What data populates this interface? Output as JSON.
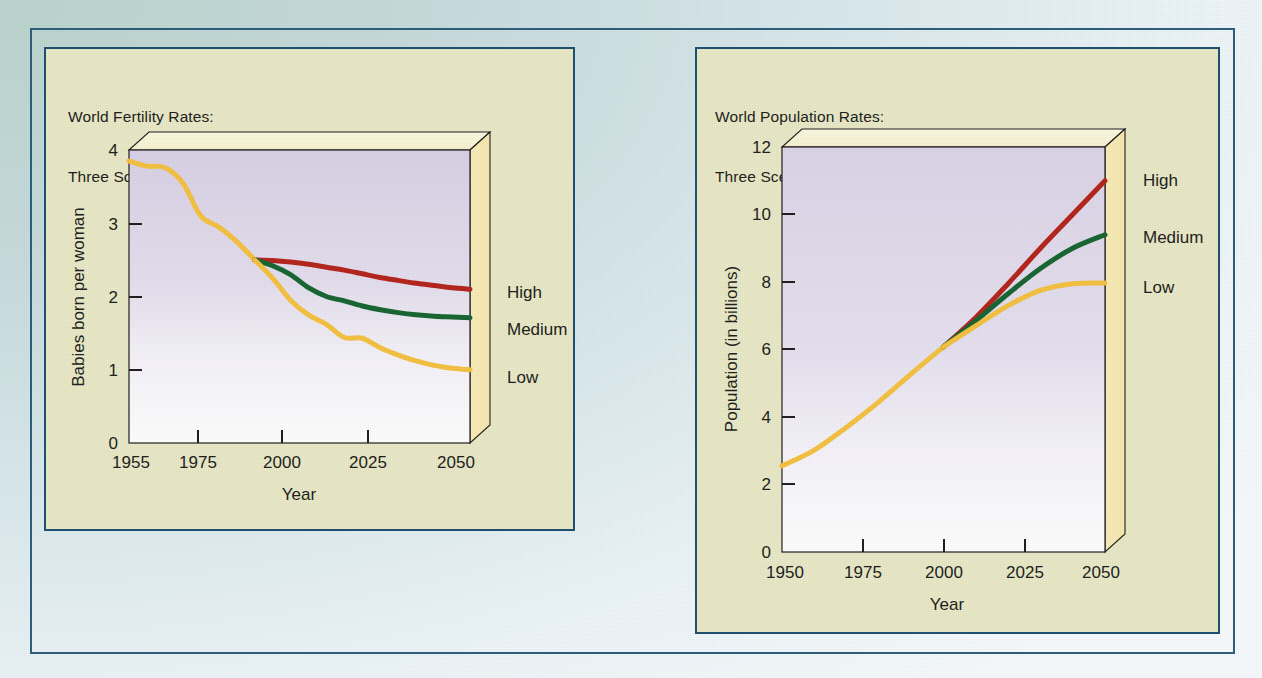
{
  "figure": {
    "background_top_left": "#bcd6cf",
    "background_bottom_right": "#f7fbfd",
    "frame_color": "#2d5f7c",
    "panel_fill": "#e9e9c8",
    "panel_border": "#1f5270"
  },
  "series_colors": {
    "high": "#b5271e",
    "medium": "#1a6634",
    "low": "#f5c242",
    "historical": "#f5c242"
  },
  "charts": [
    {
      "id": "fertility",
      "title_line1": "World Fertility Rates:",
      "title_line2": "Three Scenarios Projected by the UN",
      "legend": [
        "High",
        "Medium",
        "Low"
      ]
    },
    {
      "id": "population",
      "title_line1": "World Population Rates:",
      "title_line2": "Three Scenarios Projected by the UN",
      "legend": [
        "High",
        "Medium",
        "Low"
      ]
    }
  ],
  "chart_data": [
    {
      "type": "line",
      "id": "fertility",
      "title": "World Fertility Rates: Three Scenarios Projected by the UN",
      "xlabel": "Year",
      "ylabel": "Babies born per woman",
      "xlim": [
        1955,
        2050
      ],
      "ylim": [
        0,
        4
      ],
      "xticks": [
        1955,
        1975,
        2000,
        2025,
        2050
      ],
      "xticklabels": [
        "1955",
        "1975",
        "2000",
        "2025",
        "2050"
      ],
      "yticks": [
        0,
        1,
        2,
        3,
        4
      ],
      "yticklabels": [
        "0",
        "1",
        "2",
        "3",
        "4"
      ],
      "grid": false,
      "legend_position": "right-outside",
      "series": [
        {
          "name": "Historical",
          "color": "#f5c242",
          "x": [
            1955,
            1960,
            1965,
            1970,
            1975,
            1980,
            1985,
            1990
          ],
          "values": [
            3.85,
            3.78,
            3.76,
            3.55,
            3.1,
            2.95,
            2.75,
            2.5
          ]
        },
        {
          "name": "High",
          "color": "#b5271e",
          "x": [
            1990,
            1995,
            2000,
            2005,
            2010,
            2015,
            2020,
            2025,
            2030,
            2035,
            2040,
            2045,
            2050
          ],
          "values": [
            2.5,
            2.49,
            2.47,
            2.44,
            2.4,
            2.36,
            2.31,
            2.26,
            2.22,
            2.18,
            2.15,
            2.12,
            2.1
          ]
        },
        {
          "name": "Medium",
          "color": "#1a6634",
          "x": [
            1990,
            1995,
            2000,
            2005,
            2010,
            2015,
            2020,
            2025,
            2030,
            2035,
            2040,
            2045,
            2050
          ],
          "values": [
            2.5,
            2.42,
            2.3,
            2.12,
            2.0,
            1.94,
            1.87,
            1.82,
            1.78,
            1.75,
            1.73,
            1.72,
            1.71
          ]
        },
        {
          "name": "Low",
          "color": "#f5c242",
          "x": [
            1990,
            1995,
            2000,
            2005,
            2010,
            2015,
            2020,
            2025,
            2030,
            2035,
            2040,
            2045,
            2050
          ],
          "values": [
            2.5,
            2.25,
            1.95,
            1.75,
            1.62,
            1.44,
            1.43,
            1.3,
            1.2,
            1.12,
            1.06,
            1.02,
            1.0
          ]
        }
      ]
    },
    {
      "type": "line",
      "id": "population",
      "title": "World Population Rates: Three Scenarios Projected by the UN",
      "xlabel": "Year",
      "ylabel": "Population (in billions)",
      "xlim": [
        1950,
        2050
      ],
      "ylim": [
        0,
        12
      ],
      "xticks": [
        1950,
        1975,
        2000,
        2025,
        2050
      ],
      "xticklabels": [
        "1950",
        "1975",
        "2000",
        "2025",
        "2050"
      ],
      "yticks": [
        0,
        2,
        4,
        6,
        8,
        10,
        12
      ],
      "yticklabels": [
        "0",
        "2",
        "4",
        "6",
        "8",
        "10",
        "12"
      ],
      "grid": false,
      "legend_position": "right-outside",
      "series": [
        {
          "name": "Historical",
          "color": "#f5c242",
          "x": [
            1950,
            1960,
            1970,
            1980,
            1990,
            2000
          ],
          "values": [
            2.55,
            3.02,
            3.7,
            4.45,
            5.28,
            6.08
          ]
        },
        {
          "name": "High",
          "color": "#b5271e",
          "x": [
            2000,
            2010,
            2020,
            2030,
            2040,
            2050
          ],
          "values": [
            6.08,
            6.95,
            7.95,
            9.0,
            10.0,
            11.0
          ]
        },
        {
          "name": "Medium",
          "color": "#1a6634",
          "x": [
            2000,
            2010,
            2020,
            2030,
            2040,
            2050
          ],
          "values": [
            6.08,
            6.85,
            7.65,
            8.4,
            9.0,
            9.4
          ]
        },
        {
          "name": "Low",
          "color": "#f5c242",
          "x": [
            2000,
            2010,
            2020,
            2030,
            2040,
            2050
          ],
          "values": [
            6.08,
            6.7,
            7.3,
            7.75,
            7.95,
            7.97
          ]
        }
      ]
    }
  ]
}
